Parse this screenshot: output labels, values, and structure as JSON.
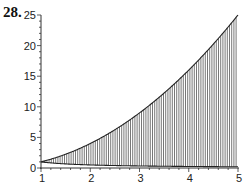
{
  "problem": {
    "number": "28."
  },
  "chart_data": {
    "type": "area",
    "title": "",
    "xlabel": "",
    "ylabel": "",
    "xlim": [
      1,
      5
    ],
    "ylim": [
      0,
      25
    ],
    "x_ticks": [
      1,
      2,
      3,
      4,
      5
    ],
    "y_ticks": [
      0,
      5,
      10,
      15,
      20,
      25
    ],
    "grid": false,
    "legend": null,
    "series": [
      {
        "name": "upper boundary y = x^2",
        "x": [
          1,
          1.5,
          2,
          2.5,
          3,
          3.5,
          4,
          4.5,
          5
        ],
        "values": [
          1,
          2.25,
          4,
          6.25,
          9,
          12.25,
          16,
          20.25,
          25
        ]
      },
      {
        "name": "lower boundary y = 1/x",
        "x": [
          1,
          1.5,
          2,
          2.5,
          3,
          3.5,
          4,
          4.5,
          5
        ],
        "values": [
          1,
          0.667,
          0.5,
          0.4,
          0.333,
          0.286,
          0.25,
          0.222,
          0.2
        ]
      }
    ],
    "fill": "vertical hatching between the two curves from x=1 to x=5"
  },
  "colors": {
    "hatch": "#555555",
    "curve": "#222222",
    "axis": "#333333"
  }
}
